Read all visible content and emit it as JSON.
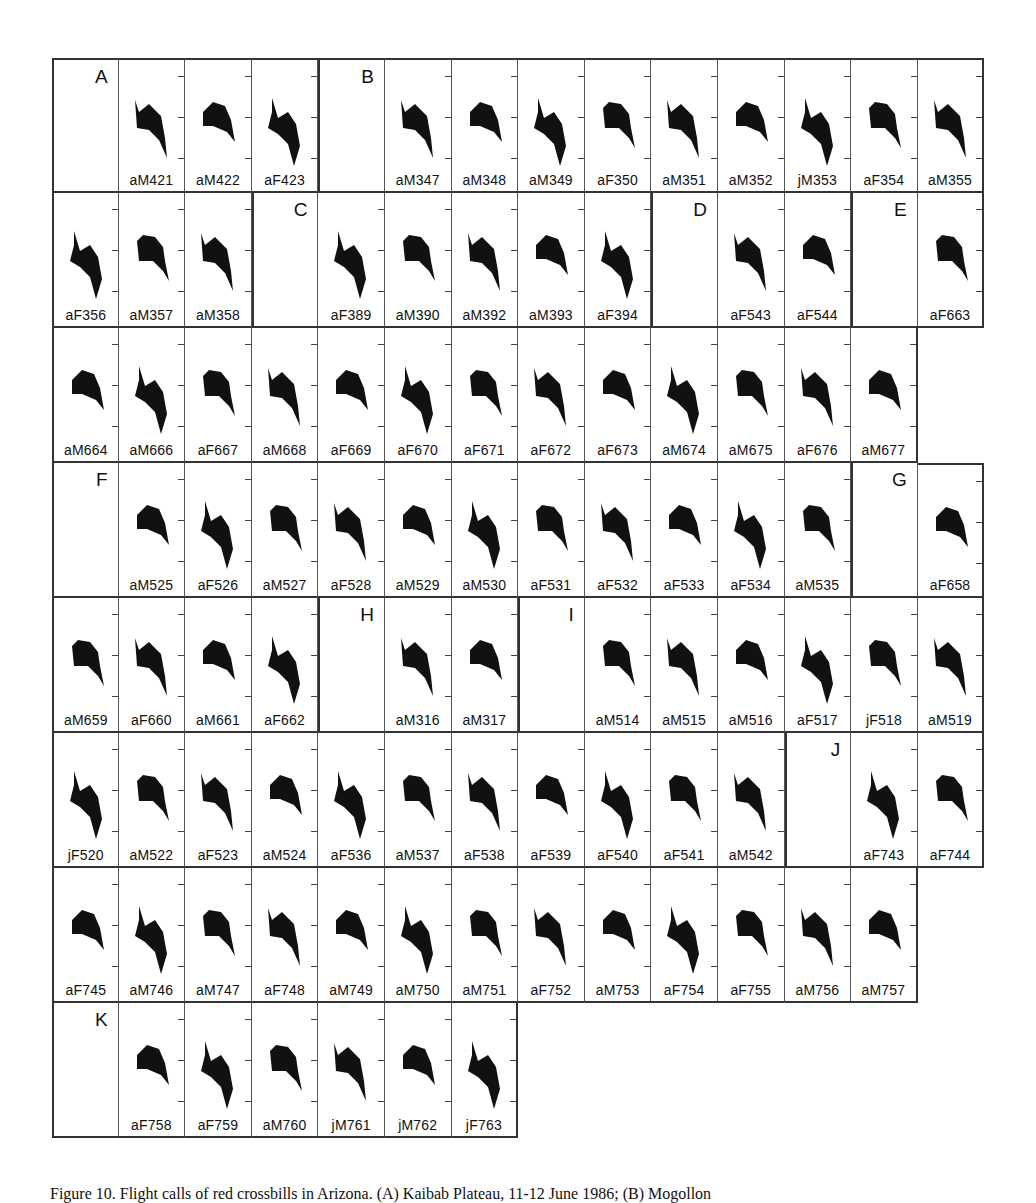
{
  "figure": {
    "rows": [
      [
        "A",
        "aM421",
        "aM422",
        "aF423",
        "B",
        "aM347",
        "aM348",
        "aM349",
        "aF350",
        "aM351",
        "aM352",
        "jM353",
        "aF354",
        "aM355"
      ],
      [
        "aF356",
        "aM357",
        "aM358",
        "C",
        "aF389",
        "aM390",
        "aM392",
        "aM393",
        "aF394",
        "D",
        "aF543",
        "aF544",
        "E",
        "aF663"
      ],
      [
        "aM664",
        "aM666",
        "aF667",
        "aM668",
        "aF669",
        "aF670",
        "aF671",
        "aF672",
        "aF673",
        "aM674",
        "aM675",
        "aF676",
        "aM677",
        ""
      ],
      [
        "F",
        "aM525",
        "aF526",
        "aM527",
        "aF528",
        "aM529",
        "aM530",
        "aF531",
        "aF532",
        "aF533",
        "aF534",
        "aM535",
        "G",
        "aF658"
      ],
      [
        "aM659",
        "aF660",
        "aM661",
        "aF662",
        "H",
        "aM316",
        "aM317",
        "I",
        "aM514",
        "aM515",
        "aM516",
        "aF517",
        "jF518",
        "aM519"
      ],
      [
        "jF520",
        "aM522",
        "aF523",
        "aM524",
        "aF536",
        "aM537",
        "aF538",
        "aF539",
        "aF540",
        "aF541",
        "aM542",
        "J",
        "aF743",
        "aF744"
      ],
      [
        "aF745",
        "aM746",
        "aM747",
        "aF748",
        "aM749",
        "aM750",
        "aM751",
        "aF752",
        "aM753",
        "aF754",
        "aF755",
        "aM756",
        "aM757",
        ""
      ],
      [
        "K",
        "aF758",
        "aF759",
        "aM760",
        "jM761",
        "jM762",
        "jF763"
      ]
    ],
    "panel_letters": [
      "A",
      "B",
      "C",
      "D",
      "E",
      "F",
      "G",
      "H",
      "I",
      "J",
      "K"
    ]
  },
  "caption": {
    "text": "Figure 10. Flight calls of red crossbills in Arizona. (A) Kaibab Plateau, 11-12 June 1986; (B) Mogollon"
  }
}
